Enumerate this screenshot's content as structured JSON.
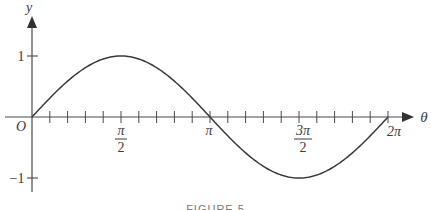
{
  "chart_data": {
    "type": "line",
    "title": "",
    "function": "y = sin(θ)",
    "xlabel": "θ",
    "ylabel": "y",
    "xlim": [
      0,
      6.2832
    ],
    "ylim": [
      -1,
      1
    ],
    "grid": false,
    "legend": null,
    "x_tick_labels": [
      "O",
      "π/2",
      "π",
      "3π/2",
      "2π"
    ],
    "x_tick_values": [
      0,
      1.5708,
      3.1416,
      4.7124,
      6.2832
    ],
    "minor_tick_step": "π/10",
    "y_tick_labels": [
      "1",
      "−1"
    ],
    "y_tick_values": [
      1,
      -1
    ],
    "series": [
      {
        "name": "sin θ",
        "x": [
          0,
          0.7854,
          1.5708,
          2.3562,
          3.1416,
          3.927,
          4.7124,
          5.4978,
          6.2832
        ],
        "y": [
          0,
          0.707,
          1,
          0.707,
          0,
          -0.707,
          -1,
          -0.707,
          0
        ]
      }
    ]
  },
  "axes": {
    "x_label": "θ",
    "y_label": "y",
    "origin_label": "O",
    "y_pos_label": "1",
    "y_neg_label": "−1",
    "pi_half": {
      "num": "π",
      "den": "2"
    },
    "pi": "π",
    "three_pi_half": {
      "num": "3π",
      "den": "2"
    },
    "two_pi": "2π"
  },
  "colors": {
    "curve": "#3a3a3a",
    "axis": "#4a4a4a",
    "background": "#ffffff"
  },
  "caption": "FIGURE 5"
}
